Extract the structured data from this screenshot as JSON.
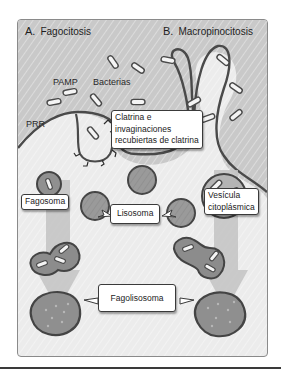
{
  "figure": {
    "panel_a": {
      "letter": "A.",
      "title": "Fagocitosis"
    },
    "panel_b": {
      "letter": "B.",
      "title": "Macropinocitosis"
    },
    "labels": {
      "pamp": "PAMP",
      "bacteria": "Bacterias",
      "prr": "PRR",
      "clathrin_line1": "Clatrina e",
      "clathrin_line2": "invaginaciones",
      "clathrin_line3": "recubiertas de clatrina",
      "phagosome": "Fagosoma",
      "lysosome": "Lisosoma",
      "vesicle_line1": "Vesícula",
      "vesicle_line2": "citoplásmica",
      "phagolysosome": "Fagolisosoma"
    },
    "colors": {
      "exterior": "#c9c9c9",
      "cytoplasm": "#ececec",
      "membrane": "#4a4a4a",
      "vesicle_fill": "#8c8c8c",
      "lysosome_fill": "#9a9a9a",
      "arrow": "#c4c4c4"
    }
  }
}
